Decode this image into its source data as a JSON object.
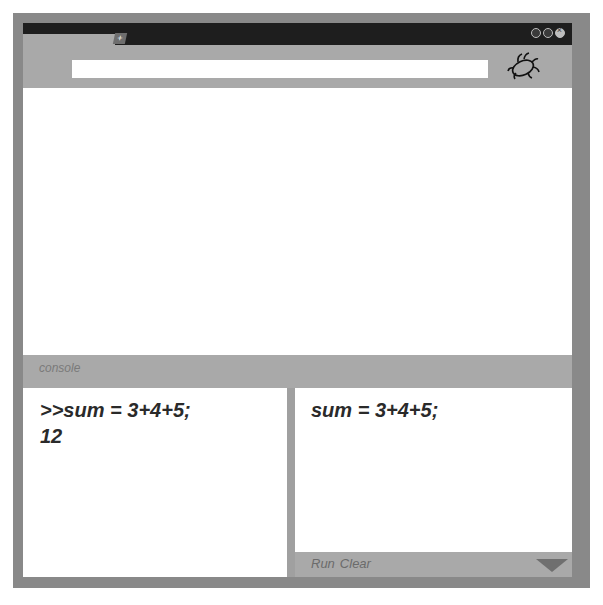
{
  "window": {
    "controls": [
      "minimize",
      "maximize",
      "close"
    ],
    "new_tab_label": "+"
  },
  "toolbar": {
    "url_value": "",
    "debug_icon": "bug-icon"
  },
  "console": {
    "label": "console",
    "output_lines": [
      ">>sum = 3+4+5;",
      "12"
    ],
    "input_code": "sum = 3+4+5;",
    "run_label": "Run",
    "clear_label": "Clear",
    "toggle_icon": "triangle-down-icon"
  },
  "colors": {
    "frame": "#898989",
    "titlebar": "#1e1e1e",
    "toolbar": "#a9a9a9",
    "text": "#2a2a2a"
  }
}
